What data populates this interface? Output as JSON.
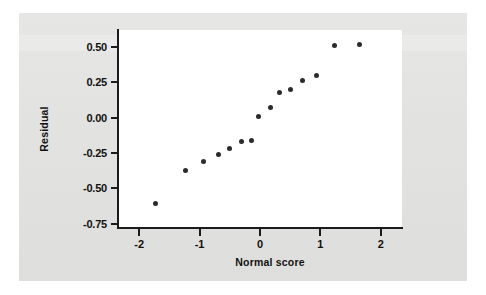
{
  "figure": {
    "background_color": "#e3e3e1",
    "plot_background_color": "#ffffff",
    "axis_color": "#1b1b1b",
    "marker_color": "#2b2b2b"
  },
  "chart_data": {
    "type": "scatter",
    "title": "",
    "xlabel": "Normal score",
    "ylabel": "Residual",
    "xlim": [
      -2.35,
      2.35
    ],
    "ylim": [
      -0.78,
      0.62
    ],
    "xticks": [
      -2,
      -1,
      0,
      1,
      2
    ],
    "xticklabels": [
      "-2",
      "-1",
      "0",
      "1",
      "2"
    ],
    "yticks": [
      0.5,
      0.25,
      0,
      -0.25,
      -0.5,
      -0.75
    ],
    "yticklabels": [
      "0.50",
      "0.25",
      "0.00",
      "-0.25",
      "-0.50",
      "-0.75"
    ],
    "grid": false,
    "legend": null,
    "marker": "circle",
    "points": [
      {
        "x": -1.73,
        "y": -0.61
      },
      {
        "x": -1.24,
        "y": -0.37
      },
      {
        "x": -0.94,
        "y": -0.31
      },
      {
        "x": -0.69,
        "y": -0.26
      },
      {
        "x": -0.5,
        "y": -0.22
      },
      {
        "x": -0.31,
        "y": -0.17
      },
      {
        "x": -0.14,
        "y": -0.16
      },
      {
        "x": -0.02,
        "y": 0.01
      },
      {
        "x": 0.17,
        "y": 0.07
      },
      {
        "x": 0.33,
        "y": 0.18
      },
      {
        "x": 0.5,
        "y": 0.2
      },
      {
        "x": 0.71,
        "y": 0.26
      },
      {
        "x": 0.93,
        "y": 0.3
      },
      {
        "x": 1.24,
        "y": 0.51
      },
      {
        "x": 1.65,
        "y": 0.52
      }
    ]
  }
}
